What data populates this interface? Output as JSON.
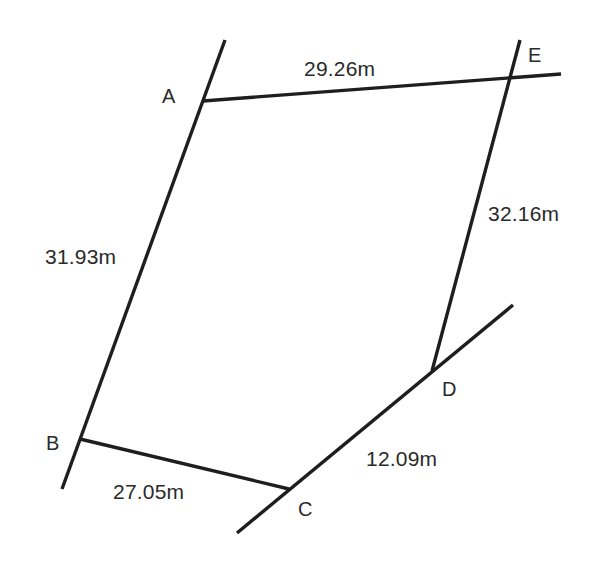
{
  "diagram": {
    "type": "land-parcel-survey",
    "points": {
      "A": {
        "label": "A",
        "x": 203,
        "y": 101
      },
      "B": {
        "label": "B",
        "x": 80,
        "y": 439
      },
      "C": {
        "label": "C",
        "x": 289,
        "y": 489
      },
      "D": {
        "label": "D",
        "x": 432,
        "y": 371
      },
      "E": {
        "label": "E",
        "x": 509,
        "y": 79
      }
    },
    "edges": [
      {
        "from": "A",
        "to": "E",
        "length": "29.26m"
      },
      {
        "from": "A",
        "to": "B",
        "length": "31.93m"
      },
      {
        "from": "B",
        "to": "C",
        "length": "27.05m"
      },
      {
        "from": "C",
        "to": "D",
        "length": "12.09m"
      },
      {
        "from": "D",
        "to": "E",
        "length": "32.16m"
      }
    ],
    "labels": {
      "ae": "29.26m",
      "ab": "31.93m",
      "bc": "27.05m",
      "cd": "12.09m",
      "de": "32.16m",
      "A": "A",
      "B": "B",
      "C": "C",
      "D": "D",
      "E": "E"
    },
    "line_color": "#1e1e1e",
    "text_color": "#2a2a2a"
  }
}
